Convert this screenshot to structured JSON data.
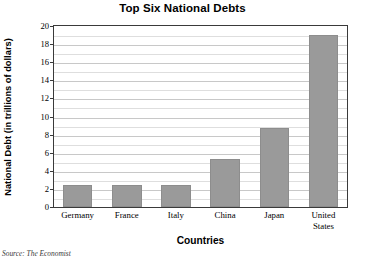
{
  "chart_data": {
    "type": "bar",
    "title": "Top Six National Debts",
    "xlabel": "Countries",
    "ylabel": "National Debt (in trillions of dollars)",
    "categories": [
      "Germany",
      "France",
      "Italy",
      "China",
      "Japan",
      "United States"
    ],
    "values": [
      2.4,
      2.4,
      2.4,
      5.3,
      8.7,
      19.0
    ],
    "ylim": [
      0,
      20
    ],
    "ytick_values": [
      0,
      2,
      4,
      6,
      8,
      10,
      12,
      14,
      16,
      18,
      20
    ],
    "ytick_labels": [
      "0",
      "2",
      "4",
      "6",
      "8",
      "10",
      "12",
      "14",
      "16",
      "18",
      "20"
    ],
    "minor_gridline_values": [
      1,
      3,
      5,
      7,
      9,
      11,
      13,
      15,
      17,
      19
    ],
    "grid": true,
    "legend": false,
    "bar_color": "#9a9a9a",
    "frame_color": "#3a3a3a",
    "gridline_color": "#c8c8c8"
  },
  "source_note": {
    "prefix": "Source:",
    "text": "The Economist"
  }
}
